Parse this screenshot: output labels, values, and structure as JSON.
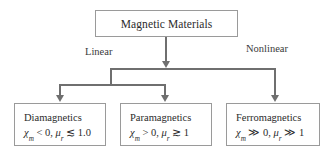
{
  "diagram": {
    "root": {
      "label": "Magnetic Materials"
    },
    "branch_labels": {
      "linear": "Linear",
      "nonlinear": "Nonlinear"
    },
    "leaves": [
      {
        "name": "diamagnetics",
        "title": "Diamagnetics",
        "chi_symbol": "χ",
        "chi_sub": "m",
        "chi_relation": "< 0,",
        "mu_symbol": "μ",
        "mu_sub": "r",
        "mu_relation": "≲ 1.0"
      },
      {
        "name": "paramagnetics",
        "title": "Paramagnetics",
        "chi_symbol": "χ",
        "chi_sub": "m",
        "chi_relation": "> 0,",
        "mu_symbol": "μ",
        "mu_sub": "r",
        "mu_relation": "≳ 1"
      },
      {
        "name": "ferromagnetics",
        "title": "Ferromagnetics",
        "chi_symbol": "χ",
        "chi_sub": "m",
        "chi_relation": "≫ 0,",
        "mu_symbol": "μ",
        "mu_sub": "r",
        "mu_relation": "≫ 1"
      }
    ],
    "colors": {
      "box_border": "#9a9a9a",
      "connector": "#6f6f6f",
      "text": "#2b2b2b",
      "background": "#ffffff"
    }
  }
}
